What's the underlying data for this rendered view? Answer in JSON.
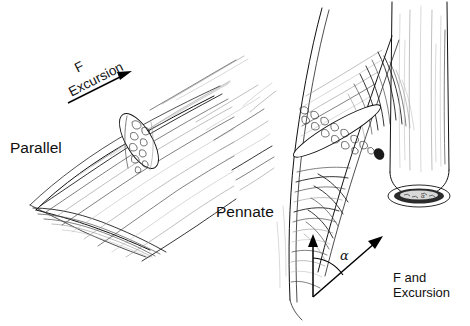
{
  "figure": {
    "width": 470,
    "height": 326,
    "background_color": "#ffffff",
    "ink_color": "#111111",
    "style": "pen-and-ink line drawing"
  },
  "labels": {
    "parallel": "Parallel",
    "pennate": "Pennate",
    "force_parallel": "F",
    "excursion_parallel": "Excursion",
    "force_excursion_pennate": "F and\nExcursion",
    "pennation_angle_symbol": "α",
    "pennation_angle_symbol_small": "α"
  },
  "annotations": {
    "parallel_arrow": {
      "label_force": "F",
      "label_excursion": "Excursion",
      "direction_degrees": -27,
      "meaning": "Force and excursion act along the long axis of the parallel fibers"
    },
    "pennate_vectors": {
      "vertical_vector_name": "tendon-axis-vector",
      "angled_vector_name": "fiber-axis-vector",
      "angle_label": "α",
      "angle_meaning": "pennation angle between fiber axis and tendon axis",
      "angled_vector_label": "F and\nExcursion"
    }
  },
  "diagram_parts": [
    {
      "name": "parallel-muscle-belly",
      "description": "Fusiform muscle belly with long fibers running end to end, cut away at upper right"
    },
    {
      "name": "parallel-cut-surface",
      "description": "Elliptical cross-section showing speckled fiber bundles"
    },
    {
      "name": "pennate-muscle-belly",
      "description": "Muscle with short fibers inserting obliquely onto a central tendon"
    },
    {
      "name": "pennate-cut-surface",
      "description": "Oblique elliptical cut surface with speckled fascicles"
    },
    {
      "name": "pennate-tendon-cylinder",
      "description": "Cylindrical tendon stump with hatched cross-section at its base"
    }
  ]
}
